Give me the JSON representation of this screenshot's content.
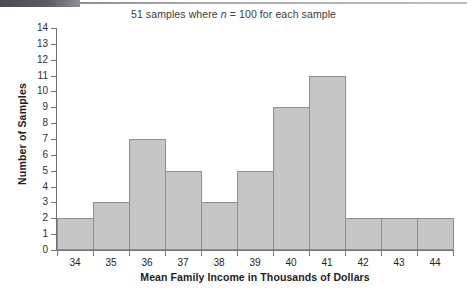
{
  "figure": {
    "title_prefix": "51 samples where ",
    "title_var": "n",
    "title_suffix": " = 100 for each sample",
    "title_full": "51 samples where n = 100 for each sample",
    "xlabel": "Mean Family Income in Thousands of Dollars",
    "ylabel": "Number of Samples",
    "bar_fill": "#c6c6c6",
    "bar_stroke": "#8e8e8e",
    "axis_color": "#6f7174",
    "background": "#ffffff"
  },
  "chart_data": {
    "type": "bar",
    "title": "51 samples where n = 100 for each sample",
    "xlabel": "Mean Family Income in Thousands of Dollars",
    "ylabel": "Number of Samples",
    "categories": [
      "34",
      "35",
      "36",
      "37",
      "38",
      "39",
      "40",
      "41",
      "42",
      "43",
      "44"
    ],
    "values": [
      2,
      3,
      7,
      5,
      3,
      5,
      9,
      11,
      2,
      2,
      2
    ],
    "ylim": [
      0,
      14
    ],
    "ytick_labels": [
      "0",
      "1",
      "2",
      "3",
      "4",
      "5",
      "6",
      "7",
      "8",
      "9",
      "10",
      "11",
      "12",
      "13",
      "14"
    ],
    "ytick_step": 1,
    "xtick_labels": [
      "34",
      "35",
      "36",
      "37",
      "38",
      "39",
      "40",
      "41",
      "42",
      "43",
      "44"
    ],
    "grid": false,
    "legend": false,
    "total_samples": 51,
    "sample_size_n": 100
  }
}
